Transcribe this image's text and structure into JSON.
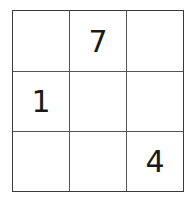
{
  "puzzle": {
    "rows": 3,
    "cols": 3,
    "cells": [
      [
        "",
        "7",
        ""
      ],
      [
        "1",
        "",
        ""
      ],
      [
        "",
        "",
        "4"
      ]
    ]
  }
}
